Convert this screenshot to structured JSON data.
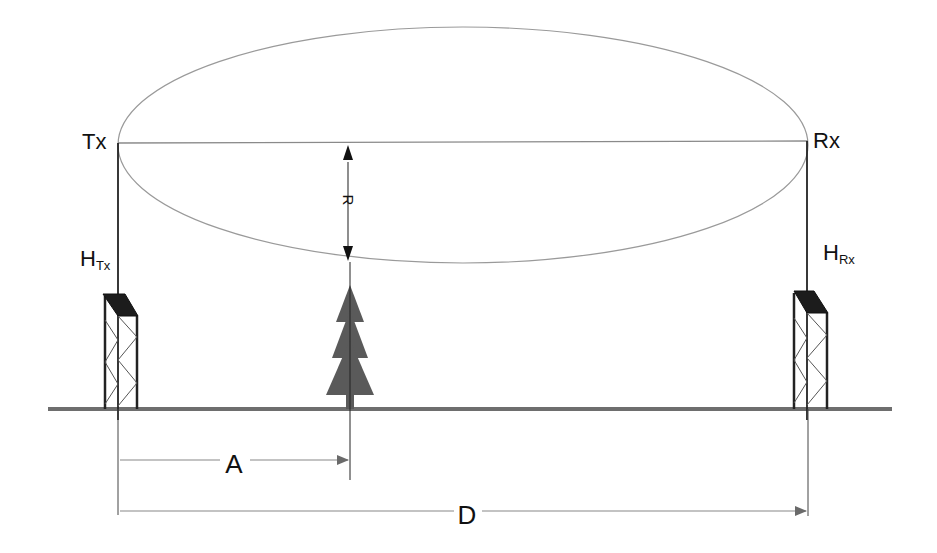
{
  "diagram": {
    "type": "fresnel-zone-clearance",
    "labels": {
      "transmitter": "Tx",
      "receiver": "Rx",
      "tx_height_main": "H",
      "tx_height_sub": "Tx",
      "rx_height_main": "H",
      "rx_height_sub": "Rx",
      "radius": "R",
      "obstacle_distance": "A",
      "total_distance": "D"
    },
    "elements": {
      "fresnel_ellipse": {
        "cx": 463,
        "cy": 145,
        "rx": 345,
        "ry": 118
      },
      "line_of_sight": {
        "x1": 118,
        "y1": 143,
        "x2": 808,
        "y2": 141
      },
      "ground_line": {
        "x1": 48,
        "x2": 892,
        "y": 409
      },
      "tx_tower": {
        "mast_x": 118,
        "left_x": 104,
        "right_x": 137,
        "top_y": 294
      },
      "rx_tower": {
        "mast_x": 807,
        "left_x": 794,
        "right_x": 827,
        "top_y": 291
      },
      "tree": {
        "x": 350,
        "top_y": 285,
        "base_y": 409
      },
      "radius_arrow": {
        "x": 348,
        "y1": 144,
        "y2": 262
      },
      "distance_A": {
        "x1": 118,
        "x2": 350,
        "y": 460
      },
      "distance_D": {
        "x1": 118,
        "x2": 808,
        "y": 511
      }
    },
    "colors": {
      "lines": "#222222",
      "ellipse": "#9a9a9a",
      "ground": "#6e6e6e",
      "tree": "#5a5a5a",
      "tower_cap": "#1c1c1c",
      "arrows": "#707070"
    }
  }
}
